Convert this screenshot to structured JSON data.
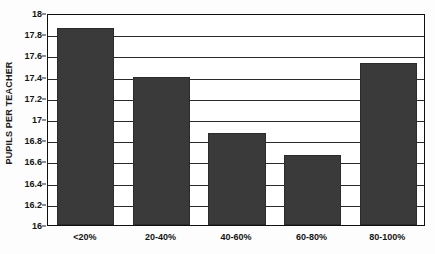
{
  "chart_data": {
    "type": "bar",
    "title": "",
    "xlabel": "",
    "ylabel": "PUPILS PER TEACHER",
    "categories": [
      "<20%",
      "20-40%",
      "40-60%",
      "60-80%",
      "80-100%"
    ],
    "values": [
      17.86,
      17.4,
      16.87,
      16.66,
      17.53
    ],
    "ylim": [
      16,
      18
    ],
    "ytick_labels": [
      "18",
      "17.8",
      "17.6",
      "17.4",
      "17.2",
      "17",
      "16.8",
      "16.6",
      "16.4",
      "16.2",
      "16"
    ],
    "ytick_values": [
      18,
      17.8,
      17.6,
      17.4,
      17.2,
      17,
      16.8,
      16.6,
      16.4,
      16.2,
      16
    ],
    "grid": true,
    "legend": false,
    "legend_position": "none",
    "series": [
      {
        "name": "Pupils per teacher",
        "values": [
          17.86,
          17.4,
          16.87,
          16.66,
          17.53
        ]
      }
    ]
  },
  "style": {
    "bar_color": "#3a3a3a",
    "bar_border_color": "#2b2b2b",
    "grid_color": "#2a2a2a",
    "frame_color": "#101010",
    "text_color": "#141414",
    "plot_background": "#ffffff",
    "page_background": "#fdfdfd"
  }
}
